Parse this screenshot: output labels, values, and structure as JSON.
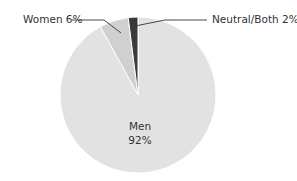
{
  "chart_data": {
    "type": "pie",
    "title": "",
    "categories": [
      "Men",
      "Women",
      "Neutral/Both"
    ],
    "values": [
      92,
      6,
      2
    ],
    "units": "%",
    "labels": [
      "Men\n92%",
      "Women 6%",
      "Neutral/Both 2%"
    ],
    "colors": [
      "#e2e2e2",
      "#d0d0d0",
      "#3a3a3a"
    ],
    "start_angle_deg": 0,
    "direction": "clockwise",
    "legend": "none (direct labels with leader lines)"
  },
  "labels": {
    "men_name": "Men",
    "men_value": "92%",
    "women": "Women 6%",
    "neutral": "Neutral/Both 2%"
  },
  "colors": {
    "men": "#e2e2e2",
    "women": "#d0d0d0",
    "neutral": "#3a3a3a",
    "separator": "#ffffff",
    "leader": "#333333",
    "text": "#333333"
  }
}
